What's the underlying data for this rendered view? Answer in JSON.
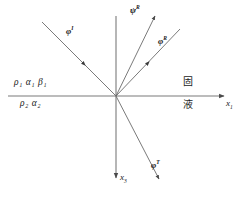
{
  "figure": {
    "background_color": "#ffffff",
    "line_color": "#6b6b6b",
    "text_color": "#1a1a1a",
    "width": 245,
    "height": 201,
    "origin": {
      "x": 116,
      "y": 96
    }
  },
  "axes": {
    "horizontal": {
      "name": "x1-axis",
      "label": "x",
      "subscript": "1",
      "from": {
        "x": 8,
        "y": 96
      },
      "to": {
        "x": 228,
        "y": 96
      },
      "arrow": "right"
    },
    "vertical": {
      "name": "x3-axis",
      "label": "x",
      "subscript": "3",
      "from": {
        "x": 116,
        "y": 16
      },
      "to": {
        "x": 116,
        "y": 182
      },
      "arrow": "down"
    }
  },
  "rays": [
    {
      "id": "incident",
      "label": "φ",
      "superscript": "I",
      "description": "incident longitudinal wave",
      "from": {
        "x": 42,
        "y": 22
      },
      "to": {
        "x": 116,
        "y": 96
      },
      "arrow_position": "middle",
      "arrow_direction": "toward-origin",
      "label_x": 66,
      "label_y": 28
    },
    {
      "id": "reflected-shear",
      "label": "ψ",
      "superscript": "R",
      "description": "reflected shear wave",
      "from": {
        "x": 116,
        "y": 96
      },
      "to": {
        "x": 157,
        "y": 12
      },
      "arrow_position": "tip",
      "arrow_direction": "outward",
      "label_x": 131,
      "label_y": 8
    },
    {
      "id": "reflected-longitudinal",
      "label": "φ",
      "superscript": "R",
      "description": "reflected longitudinal wave",
      "from": {
        "x": 116,
        "y": 96
      },
      "to": {
        "x": 180,
        "y": 29
      },
      "arrow_position": "middle",
      "arrow_direction": "outward",
      "label_x": 159,
      "label_y": 39
    },
    {
      "id": "transmitted",
      "label": "φ",
      "superscript": "T",
      "description": "transmitted longitudinal wave",
      "from": {
        "x": 116,
        "y": 96
      },
      "to": {
        "x": 160,
        "y": 182
      },
      "arrow_position": "tip",
      "arrow_direction": "outward",
      "label_x": 152,
      "label_y": 163
    }
  ],
  "media": {
    "upper": {
      "name": "upper-medium-properties",
      "symbols": [
        {
          "glyph": "ρ",
          "subscript": "1"
        },
        {
          "glyph": "α",
          "subscript": "1"
        },
        {
          "glyph": "β",
          "subscript": "1"
        }
      ],
      "text": "ρ₁ α₁ β₁",
      "x": 14,
      "y": 80
    },
    "lower": {
      "name": "lower-medium-properties",
      "symbols": [
        {
          "glyph": "ρ",
          "subscript": "2"
        },
        {
          "glyph": "α",
          "subscript": "2"
        }
      ],
      "text": "ρ₂ α₂",
      "x": 20,
      "y": 100
    }
  },
  "phase_labels": {
    "solid": {
      "text": "固",
      "meaning": "solid",
      "x": 183,
      "y": 79
    },
    "liquid": {
      "text": "液",
      "meaning": "liquid",
      "x": 183,
      "y": 101
    }
  }
}
